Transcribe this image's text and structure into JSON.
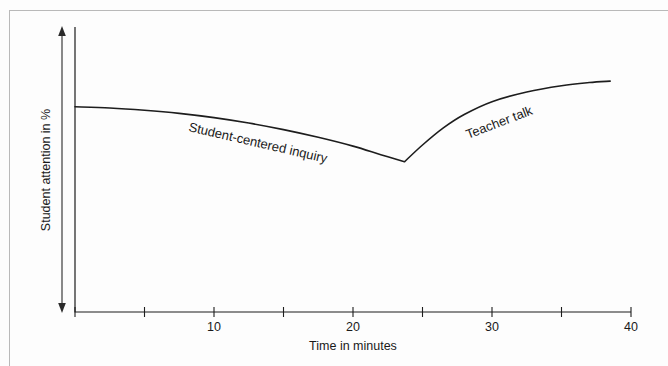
{
  "chart_data": {
    "type": "line",
    "title": "",
    "xlabel": "Time in minutes",
    "ylabel": "Student attention in %",
    "xlim": [
      0,
      40
    ],
    "ylim": [
      0,
      100
    ],
    "grid": false,
    "legend": "inline-annotations",
    "x_ticks": [
      0,
      5,
      10,
      15,
      20,
      25,
      30,
      35,
      40
    ],
    "x_tick_labels": [
      "",
      "",
      "10",
      "",
      "20",
      "",
      "30",
      "",
      "40"
    ],
    "y_ticks": [],
    "y_tick_labels": [],
    "annotations": [
      {
        "id": "phase-1",
        "text": "Student-centered inquiry",
        "x": 13.5,
        "y": 73,
        "rotation_deg": 13
      },
      {
        "id": "phase-2",
        "text": "Teacher talk",
        "x": 31.5,
        "y": 77,
        "rotation_deg": -21
      }
    ],
    "series": [
      {
        "name": "Student attention",
        "x": [
          0.0,
          2.5,
          5.0,
          7.5,
          10.0,
          12.5,
          15.0,
          17.5,
          20.0,
          22.0,
          23.7,
          25.0,
          26.5,
          28.0,
          30.0,
          32.5,
          35.0,
          37.0,
          38.5
        ],
        "values": [
          72.0,
          71.6,
          70.8,
          69.7,
          68.2,
          66.3,
          64.0,
          61.3,
          58.2,
          55.2,
          52.7,
          58.6,
          64.6,
          69.3,
          73.8,
          77.2,
          79.4,
          80.5,
          81.0
        ]
      }
    ],
    "vertex": {
      "x": 23.7,
      "y": 52.7,
      "label": "minimum attention"
    }
  },
  "x_axis": {
    "title": "Time in minutes",
    "labels": [
      {
        "value": "10",
        "at": 10
      },
      {
        "value": "20",
        "at": 20
      },
      {
        "value": "30",
        "at": 30
      },
      {
        "value": "40",
        "at": 40
      }
    ]
  },
  "y_axis": {
    "title": "Student attention in %",
    "arrow": "double-headed-vertical"
  }
}
